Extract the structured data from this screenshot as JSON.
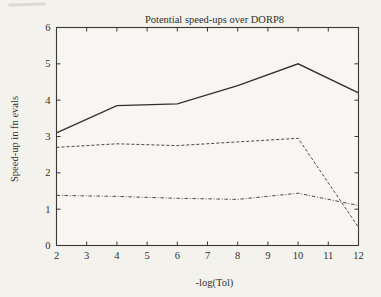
{
  "chart_data": {
    "type": "line",
    "title": "Potential speed-ups over DORP8",
    "xlabel": "-log(Tol)",
    "ylabel": "Speed-up in fn evals",
    "xlim": [
      2,
      12
    ],
    "ylim": [
      0,
      6
    ],
    "x_ticks": [
      2,
      3,
      4,
      5,
      6,
      7,
      8,
      9,
      10,
      11,
      12
    ],
    "y_ticks": [
      0,
      1,
      2,
      3,
      4,
      5,
      6
    ],
    "x": [
      2,
      4,
      6,
      8,
      10,
      12
    ],
    "series": [
      {
        "name": "solid-line",
        "style": "solid",
        "values": [
          3.1,
          3.85,
          3.9,
          4.4,
          5.0,
          4.2
        ]
      },
      {
        "name": "dashed-line",
        "style": "dashed",
        "values": [
          2.7,
          2.8,
          2.75,
          2.85,
          2.95,
          0.5
        ]
      },
      {
        "name": "dash-dot-line",
        "style": "dashdot",
        "values": [
          1.38,
          1.35,
          1.3,
          1.27,
          1.44,
          1.1
        ]
      }
    ],
    "grid": false,
    "legend": "none"
  },
  "colors": {
    "background": "#f3f2ed",
    "plot_background": "#f7f6f2",
    "axis": "#3c3933",
    "line_solid": "#33302b",
    "line_dashed": "#4c4841",
    "text": "#33302b"
  }
}
